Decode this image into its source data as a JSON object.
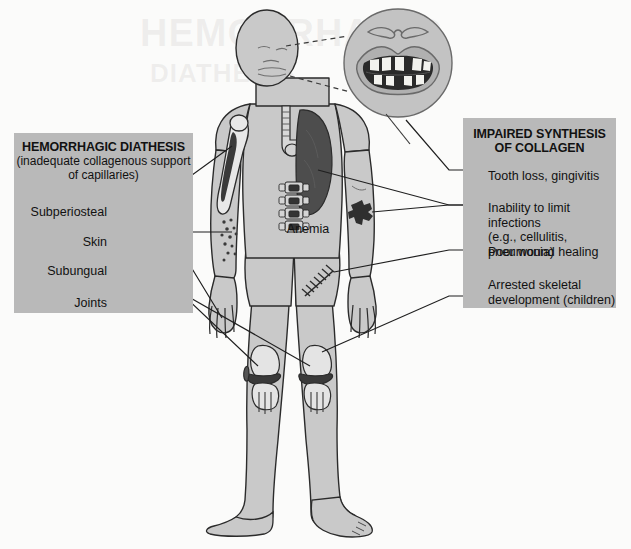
{
  "figure": {
    "background_color": "#fbfbfa",
    "panel_color": "#b9b9b9",
    "body_fill": "#c9c9c9",
    "outline_color": "#2b2b2b",
    "dark_lesion_color": "#3a3a3a"
  },
  "left_panel": {
    "title": "HEMORRHAGIC DIATHESIS",
    "subtitle": "(inadequate collagenous\nsupport of capillaries)",
    "items": [
      {
        "label": "Subperiosteal",
        "target": "humerus-subperiosteal-hemorrhage"
      },
      {
        "label": "Skin",
        "target": "forearm-petechiae"
      },
      {
        "label": "Subungual",
        "target": "fingernail-hemorrhage"
      },
      {
        "label": "Joints",
        "target": "knee-joint-hemarthrosis"
      }
    ]
  },
  "right_panel": {
    "title": "IMPAIRED SYNTHESIS\nOF COLLAGEN",
    "items": [
      {
        "label": "Tooth loss, gingivitis",
        "target": "mouth-inset"
      },
      {
        "label": "Inability to limit infections\n(e.g., cellulitis, pneumonia)",
        "target": "lung-consolidation-and-skin-cellulitis"
      },
      {
        "label": "Poor wound healing",
        "target": "sutured-wound-thigh"
      },
      {
        "label": "Arrested skeletal\ndevelopment (children)",
        "target": "lower-limb-growth-plate"
      }
    ]
  },
  "body_annotations": [
    {
      "label": "Anemia",
      "target": "vertebral-bone-marrow"
    }
  ],
  "inset": {
    "name": "magnified-mouth",
    "depicts": "open mouth with irregular, missing teeth and inflamed gums",
    "connector_style": "dashed"
  },
  "anatomy_parts": [
    "head",
    "face",
    "neck",
    "trachea",
    "bronchi",
    "lung-consolidated",
    "humerus",
    "vertebral-column",
    "torso",
    "arms",
    "hands",
    "fingers",
    "pelvis",
    "legs",
    "knee-joints",
    "feet",
    "petechiae",
    "skin-lesion",
    "sutured-wound"
  ]
}
